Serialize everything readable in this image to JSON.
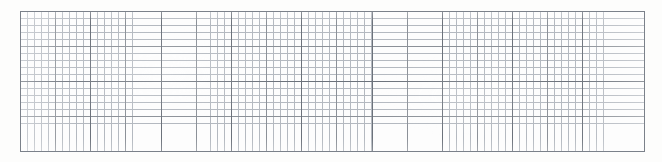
{
  "document": {
    "kind": "grid-paper-scan",
    "title": "Blank grid paper",
    "background_color": "#fdfdfc",
    "has_text": false,
    "has_annotations": false
  },
  "canvas": {
    "width": 662,
    "height": 162,
    "color": "#ffffff"
  },
  "chart_data": {
    "type": "table",
    "title": "",
    "subtitle": "",
    "xlabel": "",
    "ylabel": "",
    "series": [],
    "categories": [],
    "values": [],
    "annotations": [],
    "legend": [],
    "grid": "on",
    "grid_description": "Blank engineering/graph paper: uniform square grid with no plotted data, no axis tick labels and no legend.",
    "grid_spec": {
      "origin_x": 20,
      "origin_y": 11,
      "width": 625,
      "height": 141,
      "minor_spacing_px": 7.03,
      "medium_spacing_px": 35.15,
      "major_spacing_px": 70.3,
      "minor_per_medium": 5,
      "medium_per_major": 2,
      "approx_minor_columns": 89,
      "approx_minor_rows": 20,
      "approx_medium_columns": 18,
      "approx_medium_rows": 4
    },
    "colors": {
      "sheet": "#fdfdfd",
      "minor_line": "#b4b9c0",
      "medium_line": "#8c9198",
      "major_line": "#6c727b",
      "frame": "#7b818a"
    }
  }
}
